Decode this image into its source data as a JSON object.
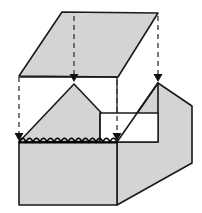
{
  "figure": {
    "canvas": {
      "width": 202,
      "height": 213
    },
    "colors": {
      "face_fill": "#d4d4d4",
      "face_fill_light": "#dcdcdc",
      "outline": "#1a1a1a",
      "outline_soft": "#3c3c3c",
      "background": "#ffffff",
      "dashed": "#333333",
      "scallop": "#000000"
    },
    "stroke_widths": {
      "outline": 1.6,
      "thin": 1.2,
      "dashed": 1.3,
      "scallop": 1.4
    },
    "dash_pattern": "5,4"
  },
  "parts": {
    "lid": {
      "name": "lid-panel",
      "points": "62,12 158,13 118,77 19,76",
      "fill": "#d4d4d4",
      "stroke": "#1a1a1a"
    },
    "box_front_face": {
      "name": "box-front-face",
      "points": "19,142 117,142 117,205 19,205",
      "fill": "#d4d4d4",
      "stroke": "#1a1a1a"
    },
    "box_right_face": {
      "name": "box-right-face",
      "points": "117,142 158,83 192,106 192,163 117,205",
      "fill": "#d4d4d4",
      "stroke": "#1a1a1a"
    },
    "inner_left_peak": {
      "name": "inner-left-peak",
      "points": "19,142 74,84 128,141",
      "fill": "#d4d4d4",
      "stroke": "#1a1a1a"
    },
    "inner_step": {
      "name": "inner-step-panel",
      "points": "100,113 158,113 158,142 100,142",
      "fill": "#ffffff",
      "stroke": "#1a1a1a"
    },
    "inner_right_wedge": {
      "name": "inner-right-wedge",
      "points": "117,142 158,83 158,142",
      "fill": "#d4d4d4",
      "stroke": "#1a1a1a"
    },
    "box_rim_top_left": {
      "name": "box-rim-top-edge",
      "points": "19,77 117,77",
      "stroke": "#1a1a1a"
    }
  },
  "guides": {
    "dashed_lines": [
      {
        "name": "guide-line-left",
        "x1": 19,
        "y1": 77,
        "x2": 19,
        "y2": 133
      },
      {
        "name": "guide-line-center",
        "x1": 74,
        "y1": 16,
        "x2": 74,
        "y2": 74
      },
      {
        "name": "guide-line-right",
        "x1": 117,
        "y1": 80,
        "x2": 117,
        "y2": 133
      },
      {
        "name": "guide-line-far-right",
        "x1": 158,
        "y1": 16,
        "x2": 158,
        "y2": 74
      }
    ],
    "arrows": [
      {
        "name": "assembly-arrow-center",
        "x": 74,
        "y": 82,
        "direction": "down"
      },
      {
        "name": "assembly-arrow-far-right",
        "x": 158,
        "y": 82,
        "direction": "down"
      },
      {
        "name": "assembly-arrow-left",
        "x": 19,
        "y": 141,
        "direction": "down"
      },
      {
        "name": "assembly-arrow-right",
        "x": 117,
        "y": 141,
        "direction": "down"
      }
    ],
    "arrow_head": {
      "half_width": 4.5,
      "length": 8
    }
  },
  "scallop_edge": {
    "name": "scalloped-rim-edge",
    "x_start": 19,
    "x_end": 117,
    "y": 142,
    "count": 14,
    "amplitude": 4,
    "stroke": "#000000",
    "description": "wavy scalloped seal line along front top rim"
  },
  "labels": {
    "none_visible": ""
  }
}
